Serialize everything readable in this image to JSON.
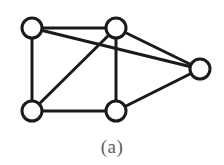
{
  "figure": {
    "caption": "(a)",
    "graph_type": "undirected-graph",
    "node_radius": 10,
    "node_stroke_width": 3,
    "edge_stroke_width": 3,
    "node_fill": "#ffffff",
    "stroke_color": "#1a1a1a",
    "background": "#ffffff",
    "caption_color": "#5c5c5c",
    "nodes": [
      {
        "id": "v1",
        "label": "top-left",
        "cx": 32,
        "cy": 28
      },
      {
        "id": "v2",
        "label": "top-middle",
        "cx": 116,
        "cy": 28
      },
      {
        "id": "v3",
        "label": "right",
        "cx": 200,
        "cy": 69
      },
      {
        "id": "v4",
        "label": "bottom-left",
        "cx": 32,
        "cy": 111
      },
      {
        "id": "v5",
        "label": "bottom-middle",
        "cx": 116,
        "cy": 111
      }
    ],
    "edges": [
      {
        "id": "e1",
        "from": "v1",
        "to": "v2",
        "x1": 32,
        "y1": 28,
        "x2": 116,
        "y2": 28
      },
      {
        "id": "e2",
        "from": "v1",
        "to": "v4",
        "x1": 32,
        "y1": 28,
        "x2": 32,
        "y2": 111
      },
      {
        "id": "e3",
        "from": "v1",
        "to": "v3",
        "x1": 32,
        "y1": 28,
        "x2": 200,
        "y2": 69
      },
      {
        "id": "e4",
        "from": "v2",
        "to": "v5",
        "x1": 116,
        "y1": 28,
        "x2": 116,
        "y2": 111
      },
      {
        "id": "e5",
        "from": "v2",
        "to": "v4",
        "x1": 116,
        "y1": 28,
        "x2": 32,
        "y2": 111
      },
      {
        "id": "e6",
        "from": "v2",
        "to": "v3",
        "x1": 116,
        "y1": 28,
        "x2": 200,
        "y2": 69
      },
      {
        "id": "e7",
        "from": "v4",
        "to": "v5",
        "x1": 32,
        "y1": 111,
        "x2": 116,
        "y2": 111
      },
      {
        "id": "e8",
        "from": "v5",
        "to": "v3",
        "x1": 116,
        "y1": 111,
        "x2": 200,
        "y2": 69
      }
    ]
  }
}
